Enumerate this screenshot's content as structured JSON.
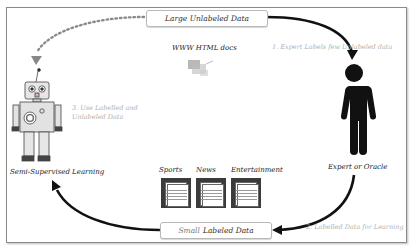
{
  "diagram": {
    "top_node": {
      "label": "Large Unlabeled Data"
    },
    "www_caption": "WWW HTML docs",
    "expert": {
      "label": "Expert or Oracle",
      "icon": "person-icon"
    },
    "learner": {
      "label": "Semi-Supervised Learning",
      "icon": "robot-icon"
    },
    "bottom_node": {
      "label_prefix": "Small",
      "label_main": "Labeled Data"
    },
    "categories": [
      "Sports",
      "News",
      "Entertainment"
    ],
    "steps": [
      {
        "text": "1. Expert Labels few Unlabeled data"
      },
      {
        "text": "2. Labelled Data for Learning"
      },
      {
        "text_line1": "3. Use Labelled and",
        "text_line2": "Unlabeled Data"
      }
    ],
    "colors": {
      "arrow": "#111111",
      "dotted_arrow": "#8a8a8a",
      "doc_dark": "#3b3b3b",
      "faded_text": "#b0b0b0"
    }
  }
}
